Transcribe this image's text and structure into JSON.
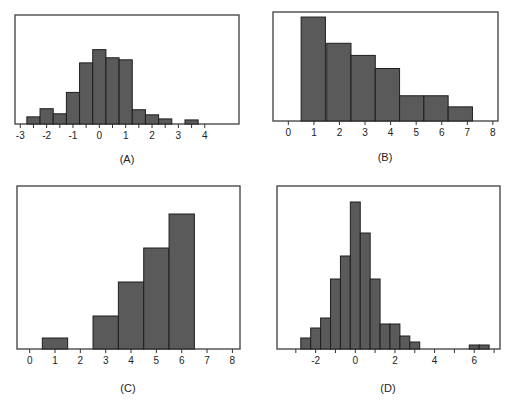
{
  "chart_data": [
    {
      "id": "A",
      "type": "bar",
      "title": "",
      "caption": "(A)",
      "xlabel": "",
      "ylabel": "",
      "grid": false,
      "xlim": [
        -3.2,
        5.3
      ],
      "xticks": [
        -3,
        -2.5,
        -2,
        -1.5,
        -1,
        -0.5,
        0,
        0.5,
        1,
        1.5,
        2,
        2.5,
        3,
        3.5,
        4
      ],
      "xtick_labels": [
        {
          "v": -3,
          "t": "-3"
        },
        {
          "v": -2,
          "t": "-2"
        },
        {
          "v": -1,
          "t": "-1"
        },
        {
          "v": 0,
          "t": "0"
        },
        {
          "v": 1,
          "t": "1"
        },
        {
          "v": 2,
          "t": "2"
        },
        {
          "v": 3,
          "t": "3"
        },
        {
          "v": 4,
          "t": "4"
        }
      ],
      "bin_width": 0.5,
      "bins": [
        {
          "x0": -2.75,
          "h": 7
        },
        {
          "x0": -2.25,
          "h": 15
        },
        {
          "x0": -1.75,
          "h": 10
        },
        {
          "x0": -1.25,
          "h": 31
        },
        {
          "x0": -0.75,
          "h": 60
        },
        {
          "x0": -0.25,
          "h": 73
        },
        {
          "x0": 0.25,
          "h": 65
        },
        {
          "x0": 0.75,
          "h": 63
        },
        {
          "x0": 1.25,
          "h": 14
        },
        {
          "x0": 1.75,
          "h": 9
        },
        {
          "x0": 2.25,
          "h": 5
        },
        {
          "x0": 3.25,
          "h": 4
        }
      ],
      "ymax": 107
    },
    {
      "id": "B",
      "type": "bar",
      "title": "",
      "caption": "(B)",
      "xlabel": "",
      "ylabel": "",
      "grid": false,
      "xlim": [
        -0.6,
        8.2
      ],
      "xticks": [
        0,
        1,
        2,
        3,
        4,
        5,
        6,
        7,
        8
      ],
      "xtick_labels": [
        {
          "v": 0,
          "t": "0"
        },
        {
          "v": 1,
          "t": "1"
        },
        {
          "v": 2,
          "t": "2"
        },
        {
          "v": 3,
          "t": "3"
        },
        {
          "v": 4,
          "t": "4"
        },
        {
          "v": 5,
          "t": "5"
        },
        {
          "v": 6,
          "t": "6"
        },
        {
          "v": 7,
          "t": "7"
        },
        {
          "v": 8,
          "t": "8"
        }
      ],
      "bin_width": 0.95,
      "bins": [
        {
          "x0": 0.5,
          "h": 103
        },
        {
          "x0": 1.5,
          "h": 77
        },
        {
          "x0": 2.45,
          "h": 65
        },
        {
          "x0": 3.4,
          "h": 52
        },
        {
          "x0": 4.35,
          "h": 25
        },
        {
          "x0": 5.3,
          "h": 25
        },
        {
          "x0": 6.25,
          "h": 14
        }
      ],
      "ymax": 108
    },
    {
      "id": "C",
      "type": "bar",
      "title": "",
      "caption": "(C)",
      "xlabel": "",
      "ylabel": "",
      "grid": false,
      "xlim": [
        -0.5,
        8.3
      ],
      "xticks": [
        0,
        1,
        2,
        3,
        4,
        5,
        6,
        7,
        8
      ],
      "xtick_labels": [
        {
          "v": 0,
          "t": "0"
        },
        {
          "v": 1,
          "t": "1"
        },
        {
          "v": 2,
          "t": "2"
        },
        {
          "v": 3,
          "t": "3"
        },
        {
          "v": 4,
          "t": "4"
        },
        {
          "v": 5,
          "t": "5"
        },
        {
          "v": 6,
          "t": "6"
        },
        {
          "v": 7,
          "t": "7"
        },
        {
          "v": 8,
          "t": "8"
        }
      ],
      "bin_width": 1,
      "bins": [
        {
          "x0": 0.5,
          "h": 11
        },
        {
          "x0": 2.5,
          "h": 33
        },
        {
          "x0": 3.5,
          "h": 67
        },
        {
          "x0": 4.5,
          "h": 101
        },
        {
          "x0": 5.5,
          "h": 135
        }
      ],
      "ymax": 163
    },
    {
      "id": "D",
      "type": "bar",
      "title": "",
      "caption": "(D)",
      "xlabel": "",
      "ylabel": "",
      "grid": false,
      "xlim": [
        -3.95,
        7.3
      ],
      "xticks": [
        -3,
        -2,
        -1,
        0,
        1,
        2,
        3,
        4,
        5,
        6,
        7
      ],
      "xtick_labels": [
        {
          "v": -2,
          "t": "-2"
        },
        {
          "v": 0,
          "t": "0"
        },
        {
          "v": 2,
          "t": "2"
        },
        {
          "v": 4,
          "t": "4"
        },
        {
          "v": 6,
          "t": "6"
        }
      ],
      "bin_width": 0.5,
      "bins": [
        {
          "x0": -2.75,
          "h": 11
        },
        {
          "x0": -2.25,
          "h": 21
        },
        {
          "x0": -1.75,
          "h": 31
        },
        {
          "x0": -1.25,
          "h": 70
        },
        {
          "x0": -0.75,
          "h": 93
        },
        {
          "x0": -0.25,
          "h": 147
        },
        {
          "x0": 0.25,
          "h": 116
        },
        {
          "x0": 0.75,
          "h": 70
        },
        {
          "x0": 1.25,
          "h": 25
        },
        {
          "x0": 1.75,
          "h": 25
        },
        {
          "x0": 2.25,
          "h": 13
        },
        {
          "x0": 2.75,
          "h": 7
        },
        {
          "x0": 5.75,
          "h": 4
        },
        {
          "x0": 6.25,
          "h": 4
        }
      ],
      "ymax": 163
    }
  ],
  "panels": [
    {
      "id": "A",
      "left": 15,
      "top": 15,
      "width": 224,
      "height": 109,
      "caption_x": 127,
      "caption_y": 153
    },
    {
      "id": "B",
      "left": 273,
      "top": 12,
      "width": 225,
      "height": 109,
      "caption_x": 385,
      "caption_y": 151
    },
    {
      "id": "C",
      "left": 17,
      "top": 186,
      "width": 223,
      "height": 163,
      "caption_x": 128,
      "caption_y": 382
    },
    {
      "id": "D",
      "left": 277,
      "top": 186,
      "width": 223,
      "height": 163,
      "caption_x": 388,
      "caption_y": 382
    }
  ],
  "colors": {
    "bar_fill": "#5a5a5a",
    "bar_stroke": "#1e1e1e",
    "frame": "#4a4a4a",
    "background": "#ffffff"
  }
}
